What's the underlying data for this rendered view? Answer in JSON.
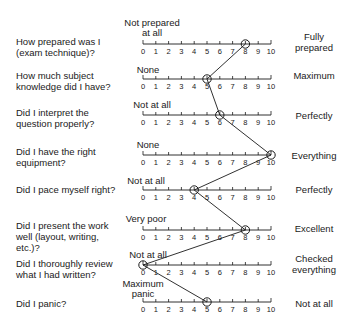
{
  "chart_data": {
    "type": "line",
    "title": "",
    "scale": {
      "min": 0,
      "max": 10,
      "ticks": [
        0,
        1,
        2,
        3,
        4,
        5,
        6,
        7,
        8,
        9,
        10
      ]
    },
    "rows": [
      {
        "question": "How prepared was I\n(exam technique)?",
        "low": "Not prepared\nat all",
        "high": "Fully\nprepared",
        "value": 8
      },
      {
        "question": "How much subject\nknowledge did I have?",
        "low": "None",
        "high": "Maximum",
        "value": 5
      },
      {
        "question": "Did I interpret the\nquestion properly?",
        "low": "Not at all",
        "high": "Perfectly",
        "value": 6
      },
      {
        "question": "Did I have the right\nequipment?",
        "low": "None",
        "high": "Everything",
        "value": 10
      },
      {
        "question": "Did I pace myself right?",
        "low": "Not at all",
        "high": "Perfectly",
        "value": 4
      },
      {
        "question": "Did I present the work\nwell  (layout, writing,\netc.)?",
        "low": "Very poor",
        "high": "Excellent",
        "value": 8
      },
      {
        "question": "Did I thoroughly review\nwhat I had written?",
        "low": "Not at all",
        "high": "Checked\neverything",
        "value": 0
      },
      {
        "question": "Did I panic?",
        "low": "Maximum\npanic",
        "high": "Not at all",
        "value": 5
      }
    ],
    "grid": false,
    "legend": null
  },
  "colors": {
    "ink": "#1a1a1a",
    "background": "#ffffff"
  }
}
